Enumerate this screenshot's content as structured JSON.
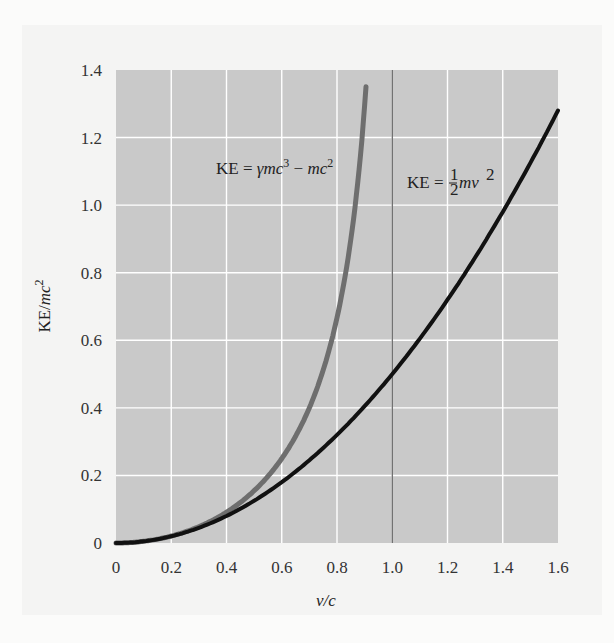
{
  "chart_data": {
    "type": "line",
    "title": "",
    "xlabel": "v/c",
    "ylabel": "KE/mc²",
    "xlim": [
      0,
      1.6
    ],
    "ylim": [
      0,
      1.4
    ],
    "grid": true,
    "x_ticks": [
      "0",
      "0.2",
      "0.4",
      "0.6",
      "0.8",
      "1.0",
      "1.2",
      "1.4",
      "1.6"
    ],
    "y_ticks": [
      "0",
      "0.2",
      "0.4",
      "0.6",
      "0.8",
      "1.0",
      "1.2",
      "1.4"
    ],
    "reference_line": {
      "axis": "x",
      "value": 1.0
    },
    "series": [
      {
        "name": "KE = γmc³ − mc²",
        "color": "#6e6e6e",
        "x": [
          0,
          0.1,
          0.2,
          0.3,
          0.4,
          0.5,
          0.6,
          0.7,
          0.8,
          0.85,
          0.9,
          0.909
        ],
        "y": [
          0,
          0.005,
          0.021,
          0.048,
          0.091,
          0.155,
          0.25,
          0.4,
          0.667,
          0.898,
          1.294,
          1.4
        ]
      },
      {
        "name": "KE = ½mv²",
        "color": "#111111",
        "x": [
          0,
          0.2,
          0.4,
          0.6,
          0.8,
          1.0,
          1.2,
          1.4,
          1.6
        ],
        "y": [
          0,
          0.02,
          0.08,
          0.18,
          0.32,
          0.5,
          0.72,
          0.98,
          1.28
        ]
      }
    ],
    "annotations": [
      {
        "text": "KE = γmc³ − mc²",
        "x": 0.55,
        "y": 1.15
      },
      {
        "text": "KE = ½mv²",
        "x": 1.25,
        "y": 1.07
      }
    ]
  },
  "labels": {
    "xlabel": "v/c",
    "ylabel_main": "KE/",
    "ylabel_mc": "mc",
    "ylabel_exp": "2",
    "rel_ke": "KE = ",
    "rel_gamma": "γmc",
    "rel_exp3": "3",
    "rel_minus": " − ",
    "rel_mc": "mc",
    "rel_exp2": "2",
    "cls_ke": "KE = ",
    "cls_num": "1",
    "cls_den": "2",
    "cls_mv": "mv",
    "cls_exp": "2"
  },
  "style": {
    "plot_bg": "#c9c9c9",
    "grid_color": "#ffffff",
    "rel_color": "#6e6e6e",
    "cls_color": "#111111",
    "refline_color": "#444444"
  }
}
